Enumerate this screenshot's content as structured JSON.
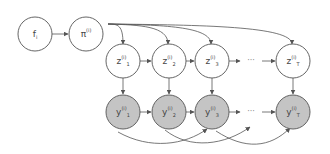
{
  "diagram": {
    "colors": {
      "edge": "#555555",
      "node_stroke": "#555555",
      "latent_fill": "#ffffff",
      "observed_fill": "#c4c4c4"
    },
    "nodes": {
      "f": {
        "base": "f",
        "sup": "",
        "sub": "i",
        "cx": 35,
        "cy": 34,
        "observed": false
      },
      "pi": {
        "base": "π",
        "sup": "(i)",
        "sub": "",
        "cx": 86,
        "cy": 34,
        "observed": false
      },
      "z1": {
        "base": "z",
        "sup": "(i)",
        "sub": "1",
        "cx": 123,
        "cy": 61,
        "observed": false
      },
      "z2": {
        "base": "z",
        "sup": "(i)",
        "sub": "2",
        "cx": 169,
        "cy": 61,
        "observed": false
      },
      "z3": {
        "base": "z",
        "sup": "(i)",
        "sub": "3",
        "cx": 212,
        "cy": 61,
        "observed": false
      },
      "zT": {
        "base": "z",
        "sup": "(i)",
        "sub": "T",
        "cx": 293,
        "cy": 61,
        "observed": false
      },
      "y1": {
        "base": "y",
        "sup": "(i)",
        "sub": "1",
        "cx": 123,
        "cy": 112,
        "observed": true
      },
      "y2": {
        "base": "y",
        "sup": "(i)",
        "sub": "2",
        "cx": 169,
        "cy": 112,
        "observed": true
      },
      "y3": {
        "base": "y",
        "sup": "(i)",
        "sub": "3",
        "cx": 212,
        "cy": 112,
        "observed": true
      },
      "yT": {
        "base": "y",
        "sup": "(i)",
        "sub": "T",
        "cx": 293,
        "cy": 112,
        "observed": true
      }
    },
    "ellipsis": {
      "z_row": "···",
      "y_row": "···"
    }
  }
}
